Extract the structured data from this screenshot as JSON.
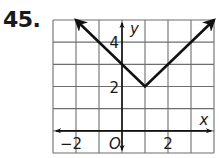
{
  "problem": {
    "number": "45."
  },
  "chart_data": {
    "type": "line",
    "title": "",
    "xlabel": "x",
    "ylabel": "y",
    "origin_label": "O",
    "xlim": [
      -3,
      4
    ],
    "ylim": [
      -1,
      5
    ],
    "grid": true,
    "x_tick_labels": [
      {
        "value": -2,
        "label": "−2"
      },
      {
        "value": 2,
        "label": "2"
      }
    ],
    "y_tick_labels": [
      {
        "value": 4,
        "label": "4"
      },
      {
        "value": 2,
        "label": "2"
      }
    ],
    "series": [
      {
        "name": "y = |x − 1| + 2",
        "points": [
          {
            "x": -2,
            "y": 5
          },
          {
            "x": 1,
            "y": 2
          },
          {
            "x": 4,
            "y": 5
          }
        ],
        "arrows_at_ends": true,
        "color": "#111111"
      }
    ],
    "vertex": {
      "x": 1,
      "y": 2
    },
    "y_intercept": 3
  },
  "colors": {
    "grid": "#6e6e6e",
    "axis": "#111111",
    "curve": "#111111",
    "text": "#1a1a1a"
  }
}
